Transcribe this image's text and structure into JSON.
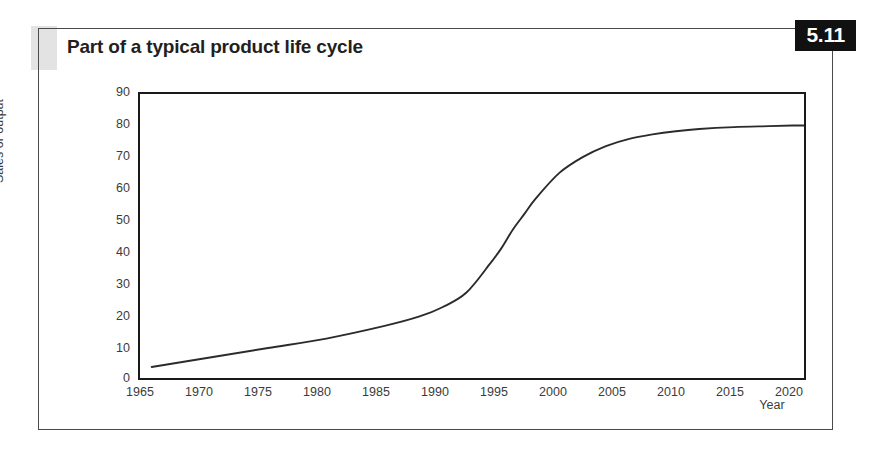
{
  "figure": {
    "title": "Part of a typical product life cycle",
    "badge": "5.11"
  },
  "chart_data": {
    "type": "line",
    "title": "Part of a typical product life cycle",
    "xlabel": "Year",
    "ylabel": "Sales or output",
    "xlim": [
      1964,
      2021
    ],
    "ylim": [
      0,
      90
    ],
    "grid": false,
    "legend": null,
    "line_color": "#2b2b2b",
    "x_ticks": [
      1965,
      1970,
      1975,
      1980,
      1985,
      1990,
      1995,
      2000,
      2005,
      2010,
      2015,
      2020
    ],
    "y_ticks": [
      0,
      10,
      20,
      30,
      40,
      50,
      60,
      70,
      80,
      90
    ],
    "series": [
      {
        "name": "Sales or output",
        "x": [
          1965,
          1970,
          1975,
          1980,
          1985,
          1988,
          1990,
          1992,
          1994,
          1995,
          1996,
          1997,
          1998,
          2000,
          2002,
          2004,
          2006,
          2008,
          2010,
          2012,
          2015,
          2018,
          2020,
          2021
        ],
        "values": [
          3.5,
          6.5,
          9.5,
          12.5,
          16.5,
          19.5,
          22.5,
          27,
          36,
          41,
          47,
          52,
          57,
          65,
          70,
          73.5,
          75.8,
          77.2,
          78.2,
          78.9,
          79.5,
          79.8,
          80,
          80
        ]
      }
    ]
  },
  "axes": {
    "y_ticks": [
      "90",
      "80",
      "70",
      "60",
      "50",
      "40",
      "30",
      "20",
      "10",
      "0"
    ],
    "x_ticks": [
      "1965",
      "1970",
      "1975",
      "1980",
      "1985",
      "1990",
      "1995",
      "2000",
      "2005",
      "2010",
      "2015",
      "2020"
    ],
    "y_title": "Sales or output",
    "x_title": "Year"
  }
}
